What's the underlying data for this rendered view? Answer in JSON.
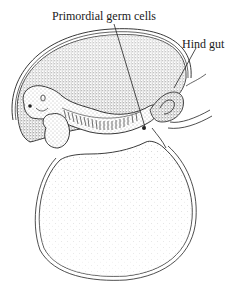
{
  "figure": {
    "labels": [
      {
        "id": "primordial-germ-cells",
        "text": "Primordial germ cells",
        "x": 52,
        "y": 8
      },
      {
        "id": "hind-gut",
        "text": "Hind gut",
        "x": 182,
        "y": 36
      }
    ],
    "colors": {
      "ink": "#1a1a1a",
      "stipple_dark": "#555555",
      "stipple_light": "#b5b5b5",
      "background": "#ffffff"
    }
  }
}
